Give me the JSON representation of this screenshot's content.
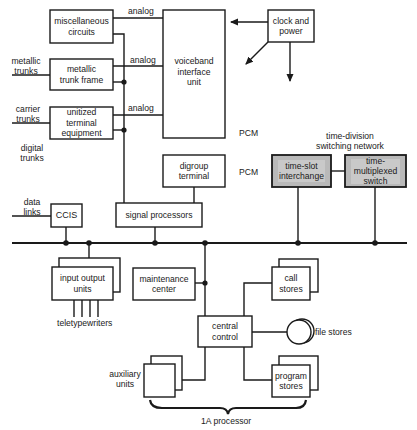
{
  "diagram": {
    "colors": {
      "line": "#1a1a1a",
      "background": "#ffffff",
      "network_fill": "#b9b9b9",
      "network_inner": "#c9c9c9"
    },
    "blocks": {
      "misc_circuits": "miscellaneous\ncircuits",
      "metallic_trunk_frame": "metallic\ntrunk frame",
      "unitized_terminal": "unitized\nterminal\nequipment",
      "voiceband_unit": "voiceband\ninterface\nunit",
      "clock_power": "clock and\npower",
      "digroup_terminal": "digroup\nterminal",
      "signal_processors": "signal processors",
      "ccis": "CCIS",
      "time_slot_interchange": "time-slot\ninterchange",
      "time_multiplexed_switch": "time-\nmultiplexed\nswitch",
      "input_output_units": "input output\nunits",
      "maintenance_center": "maintenance\ncenter",
      "central_control": "central\ncontrol",
      "call_stores": "call\nstores",
      "program_stores": "program\nstores",
      "auxiliary_units": ""
    },
    "labels": {
      "analog_1": "analog",
      "analog_2": "analog",
      "analog_3": "analog",
      "metallic_trunks": "metallic\ntrunks",
      "carrier_trunks": "carrier\ntrunks",
      "digital_trunks": "digital\ntrunks",
      "data_links": "data\nlinks",
      "pcm_1": "PCM",
      "pcm_2": "PCM",
      "network_title": "time-division\nswitching network",
      "teletypewriters": "teletypewriters",
      "auxiliary_units": "auxiliary\nunits",
      "file_stores": "file stores",
      "processor": "1A processor"
    }
  }
}
